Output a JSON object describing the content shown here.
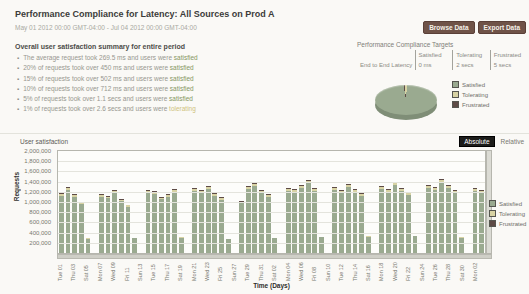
{
  "header": {
    "title": "Performance Compliance for Latency: All Sources on Prod A",
    "date_range": "May 01 2012 00:00 GMT-04:00 - Jul 04 2012 00:00 GMT-04:00",
    "browse_button": "Browse Data",
    "export_button": "Export Data"
  },
  "summary": {
    "heading": "Overall user satisfaction summary for entire period",
    "bullets": [
      {
        "text": "The average request took 269.5 ms and users were",
        "status": "satisfied"
      },
      {
        "text": "20% of requests took over 450 ms and users were",
        "status": "satisfied"
      },
      {
        "text": "15% of requests took over 502 ms and users were",
        "status": "satisfied"
      },
      {
        "text": "10% of requests took over 712 ms and users were",
        "status": "satisfied"
      },
      {
        "text": "5% of requests took over 1.1 secs and users were",
        "status": "satisfied"
      },
      {
        "text": "1% of requests took over 2.6 secs and users were",
        "status": "tolerating"
      }
    ]
  },
  "targets": {
    "title": "Performance Compliance Targets",
    "columns": [
      "Satisfied",
      "Tolerating",
      "Frustrated"
    ],
    "row_label": "End to End Latency",
    "row_values": [
      "0 ms",
      "2 secs",
      "5 secs"
    ]
  },
  "legend": {
    "items": [
      {
        "key": "satisfied",
        "label": "Satisfied"
      },
      {
        "key": "tolerating",
        "label": "Tolerating"
      },
      {
        "key": "frustrated",
        "label": "Frustrated"
      }
    ]
  },
  "user_chart": {
    "title": "User satisfaction",
    "absolute_button": "Absolute",
    "relative_button": "Relative"
  },
  "colors": {
    "satisfied": "#9aaa90",
    "tolerating": "#d8d3a4",
    "frustrated": "#5e4b46",
    "status": {
      "satisfied": "#85975f",
      "tolerating": "#cfc27c"
    }
  },
  "chart_data": [
    {
      "type": "pie",
      "style": "3d",
      "legend_position": "right",
      "slices": [
        {
          "key": "satisfied",
          "label": "Satisfied",
          "value": 96.5
        },
        {
          "key": "tolerating",
          "label": "Tolerating",
          "value": 2.3
        },
        {
          "key": "frustrated",
          "label": "Frustrated",
          "value": 1.2
        }
      ]
    },
    {
      "type": "bar",
      "stacked": true,
      "title": "User satisfaction",
      "xlabel": "Time (Days)",
      "ylabel": "Requests",
      "ylim": [
        0,
        2000000
      ],
      "ytick_step": 200000,
      "x_tick_every": 2,
      "x_tick_labels": [
        "Tue 01",
        "Thu 03",
        "Sat 05",
        "Mon 07",
        "Wed 09",
        "Fri 11",
        "Sun 13",
        "Tue 15",
        "Thu 17",
        "Sat 19",
        "Mon 21",
        "Wed 23",
        "Fri 25",
        "Sun 27",
        "Tue 29",
        "Thu 31",
        "Sat 02",
        "Mon 04",
        "Wed 06",
        "Fri 08",
        "Sun 10",
        "Tue 12",
        "Thu 14",
        "Sat 16",
        "Mon 18",
        "Wed 20",
        "Fri 22",
        "Sun 24",
        "Tue 26",
        "Thu 28",
        "Sat 30",
        "Mon 02"
      ],
      "totals": [
        1180000,
        1290000,
        1150000,
        1010000,
        290000,
        0,
        1160000,
        1120000,
        1240000,
        1060000,
        950000,
        300000,
        0,
        1230000,
        1210000,
        1100000,
        1160000,
        1250000,
        310000,
        0,
        1270000,
        1240000,
        1310000,
        1180000,
        1090000,
        280000,
        0,
        1020000,
        1320000,
        1380000,
        1240000,
        1150000,
        300000,
        0,
        1280000,
        1260000,
        1330000,
        1440000,
        1270000,
        320000,
        0,
        1290000,
        1230000,
        1350000,
        1260000,
        1170000,
        330000,
        0,
        1310000,
        1260000,
        1400000,
        1280000,
        1190000,
        340000,
        0,
        1330000,
        1300000,
        1450000,
        1340000,
        1230000,
        310000,
        0,
        1280000,
        1240000
      ],
      "stack_fractions": {
        "satisfied": 0.955,
        "tolerating": 0.03,
        "frustrated": 0.015
      },
      "legend_position": "right",
      "grid": true
    }
  ]
}
